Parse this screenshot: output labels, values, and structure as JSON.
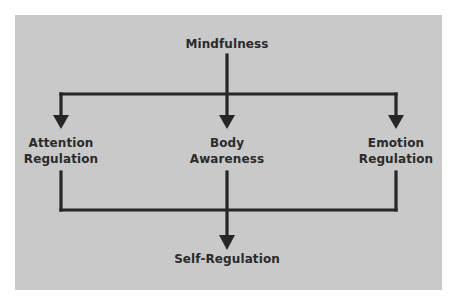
{
  "diagram": {
    "top_node": "Mindfulness",
    "middle_nodes": [
      {
        "line1": "Attention",
        "line2": "Regulation"
      },
      {
        "line1": "Body",
        "line2": "Awareness"
      },
      {
        "line1": "Emotion",
        "line2": "Regulation"
      }
    ],
    "bottom_node": "Self-Regulation"
  },
  "colors": {
    "background": "#c9c9c9",
    "line": "#262626",
    "text": "#2b2b2b"
  }
}
